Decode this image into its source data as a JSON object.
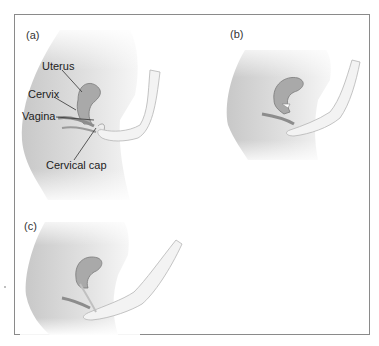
{
  "figure": {
    "panels": [
      {
        "id": "a",
        "label": "(a)",
        "annotations": [
          {
            "key": "uterus",
            "text": "Uterus"
          },
          {
            "key": "cervix",
            "text": "Cervix"
          },
          {
            "key": "vagina",
            "text": "Vagina"
          },
          {
            "key": "cervical_cap",
            "text": "Cervical cap"
          }
        ]
      },
      {
        "id": "b",
        "label": "(b)",
        "annotations": []
      },
      {
        "id": "c",
        "label": "(c)",
        "annotations": []
      }
    ],
    "colors": {
      "border": "#8a8a8a",
      "body_fill": "#d9d9d9",
      "body_shadow": "#bdbdbd",
      "organ_fill": "#9e9e9e",
      "organ_dark": "#7a7a7a",
      "hand_fill": "#f2f2f2",
      "leader_line": "#333333"
    }
  }
}
